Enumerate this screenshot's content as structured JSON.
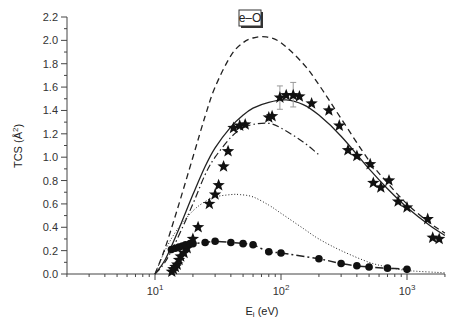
{
  "chart_data": {
    "type": "line",
    "title": "e–O",
    "xlabel": "E_i (eV)",
    "ylabel": "TCS (Å²)",
    "xscale": "log",
    "xlim": [
      2,
      2000
    ],
    "ylim": [
      0.0,
      2.2
    ],
    "grid": false,
    "legend_position": "top-center",
    "x_tick_labels": [
      "10¹",
      "10²",
      "10³"
    ],
    "x_ticks": [
      10,
      100,
      1000
    ],
    "y_tick_labels": [
      "0.0",
      "0.2",
      "0.4",
      "0.6",
      "0.8",
      "1.0",
      "1.2",
      "1.4",
      "1.6",
      "1.8",
      "2.0",
      "2.2"
    ],
    "y_ticks": [
      0.0,
      0.2,
      0.4,
      0.6,
      0.8,
      1.0,
      1.2,
      1.4,
      1.6,
      1.8,
      2.0,
      2.2
    ],
    "series": [
      {
        "name": "dashed curve",
        "style": "dashed",
        "x": [
          10,
          12,
          15,
          20,
          25,
          30,
          40,
          50,
          60,
          76,
          100,
          150,
          200,
          300,
          500,
          700,
          1000,
          1500,
          2000
        ],
        "y": [
          0.0,
          0.22,
          0.55,
          1.0,
          1.35,
          1.6,
          1.87,
          1.98,
          2.02,
          2.03,
          1.98,
          1.8,
          1.62,
          1.33,
          0.97,
          0.78,
          0.6,
          0.44,
          0.35
        ]
      },
      {
        "name": "solid curve",
        "style": "solid",
        "x": [
          10,
          12,
          15,
          20,
          25,
          30,
          40,
          50,
          60,
          80,
          110,
          150,
          200,
          300,
          500,
          700,
          1000,
          1500,
          2000
        ],
        "y": [
          0.0,
          0.12,
          0.35,
          0.68,
          0.92,
          1.08,
          1.26,
          1.36,
          1.42,
          1.47,
          1.49,
          1.45,
          1.36,
          1.18,
          0.9,
          0.73,
          0.57,
          0.42,
          0.33
        ]
      },
      {
        "name": "dash-dot curve",
        "style": "dash-dot",
        "x": [
          10,
          12,
          15,
          20,
          25,
          30,
          40,
          50,
          60,
          80,
          100,
          150,
          200
        ],
        "y": [
          0.0,
          0.1,
          0.3,
          0.6,
          0.85,
          1.0,
          1.17,
          1.25,
          1.28,
          1.29,
          1.25,
          1.13,
          1.02
        ]
      },
      {
        "name": "dotted curve",
        "style": "dotted",
        "x": [
          10,
          12,
          15,
          20,
          25,
          30,
          40,
          47,
          60,
          80,
          100,
          150,
          200,
          300,
          500,
          700,
          1000,
          2000
        ],
        "y": [
          0.0,
          0.2,
          0.38,
          0.54,
          0.62,
          0.66,
          0.68,
          0.68,
          0.66,
          0.59,
          0.52,
          0.39,
          0.3,
          0.2,
          0.1,
          0.06,
          0.03,
          0.01
        ]
      },
      {
        "name": "star markers",
        "style": "markers-star",
        "x": [
          13.6,
          14,
          14.5,
          15,
          15.5,
          16,
          17,
          18,
          20,
          22,
          27,
          30,
          32,
          35,
          38,
          42,
          47,
          52,
          80,
          85,
          98,
          110,
          125,
          140,
          175,
          240,
          290,
          340,
          400,
          510,
          540,
          620,
          720,
          850,
          1000,
          1460,
          1600,
          1800
        ],
        "y": [
          0.02,
          0.04,
          0.06,
          0.08,
          0.12,
          0.15,
          0.18,
          0.22,
          0.3,
          0.4,
          0.6,
          0.68,
          0.76,
          0.92,
          1.05,
          1.25,
          1.27,
          1.28,
          1.34,
          1.35,
          1.51,
          1.53,
          1.53,
          1.52,
          1.46,
          1.4,
          1.27,
          1.06,
          1.01,
          0.94,
          0.78,
          0.74,
          0.8,
          0.62,
          0.57,
          0.47,
          0.31,
          0.3
        ],
        "error_bars": [
          {
            "x": 98,
            "y": 1.51,
            "low": 1.41,
            "high": 1.61
          },
          {
            "x": 125,
            "y": 1.53,
            "low": 1.43,
            "high": 1.64
          }
        ]
      },
      {
        "name": "filled circle markers",
        "style": "markers-circle-dash-dot",
        "x": [
          13.5,
          14.5,
          15.5,
          16.5,
          17.5,
          19,
          20,
          25,
          30,
          40,
          50,
          60,
          80,
          100,
          200,
          300,
          400,
          500,
          700,
          1000
        ],
        "y": [
          0.21,
          0.22,
          0.23,
          0.24,
          0.25,
          0.26,
          0.26,
          0.27,
          0.28,
          0.27,
          0.26,
          0.25,
          0.19,
          0.18,
          0.13,
          0.09,
          0.07,
          0.06,
          0.05,
          0.04
        ]
      }
    ]
  }
}
